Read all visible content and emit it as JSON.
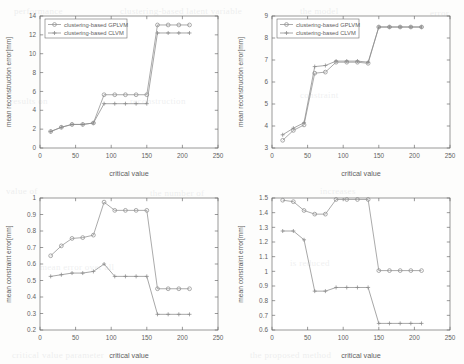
{
  "figure": {
    "legend_labels": [
      "clustering-based GPLVM",
      "clustering-based CLVM"
    ],
    "series_colors": [
      "#8f8f8f",
      "#8a8a8a"
    ],
    "xlabel": "critical value",
    "background": "#fdfdfc"
  },
  "ghost_text": [
    {
      "t": "performance",
      "x": 14,
      "y": 6
    },
    {
      "t": "clustering-based latent variable",
      "x": 120,
      "y": 6
    },
    {
      "t": "the model",
      "x": 300,
      "y": 6
    },
    {
      "t": "error",
      "x": 430,
      "y": 8
    },
    {
      "t": "results on",
      "x": 10,
      "y": 96
    },
    {
      "t": "reconstruction",
      "x": 130,
      "y": 96
    },
    {
      "t": "constraint",
      "x": 300,
      "y": 90
    },
    {
      "t": "value of",
      "x": 6,
      "y": 186
    },
    {
      "t": "the number of",
      "x": 150,
      "y": 188
    },
    {
      "t": "increases",
      "x": 320,
      "y": 186
    },
    {
      "t": "mean error over all",
      "x": 40,
      "y": 262
    },
    {
      "t": "is reduced",
      "x": 290,
      "y": 258
    },
    {
      "t": "critical value parameter",
      "x": 12,
      "y": 350
    },
    {
      "t": "the proposed method",
      "x": 250,
      "y": 350
    }
  ],
  "chart_data": [
    {
      "type": "line",
      "panel": "top-left",
      "title": "",
      "xlabel": "critical value",
      "ylabel": "mean reconstruction error[mm]",
      "xlim": [
        0,
        250
      ],
      "ylim": [
        0,
        14
      ],
      "xticks": [
        0,
        50,
        100,
        150,
        200,
        250
      ],
      "yticks": [
        0,
        2,
        4,
        6,
        8,
        10,
        12,
        14
      ],
      "grid": false,
      "legend_position": "upper left",
      "series": [
        {
          "name": "clustering-based GPLVM",
          "marker": "circle",
          "x": [
            15,
            30,
            45,
            60,
            75,
            90,
            105,
            120,
            135,
            150,
            165,
            180,
            195,
            210
          ],
          "y": [
            1.75,
            2.2,
            2.5,
            2.5,
            2.65,
            5.65,
            5.65,
            5.65,
            5.65,
            5.65,
            13.05,
            13.05,
            13.05,
            13.05
          ]
        },
        {
          "name": "clustering-based CLVM",
          "marker": "plus",
          "x": [
            15,
            30,
            45,
            60,
            75,
            90,
            105,
            120,
            135,
            150,
            165,
            180,
            195,
            210
          ],
          "y": [
            1.75,
            2.2,
            2.5,
            2.5,
            2.65,
            4.7,
            4.7,
            4.7,
            4.7,
            4.7,
            12.2,
            12.2,
            12.2,
            12.2
          ]
        }
      ]
    },
    {
      "type": "line",
      "panel": "top-right",
      "title": "",
      "xlabel": "critical value",
      "ylabel": "mean reconstruction error[mm]",
      "xlim": [
        0,
        250
      ],
      "ylim": [
        3,
        9
      ],
      "xticks": [
        0,
        50,
        100,
        150,
        200,
        250
      ],
      "yticks": [
        3,
        4,
        5,
        6,
        7,
        8,
        9
      ],
      "grid": false,
      "legend_position": "upper left",
      "series": [
        {
          "name": "clustering-based GPLVM",
          "marker": "circle",
          "x": [
            15,
            30,
            45,
            60,
            75,
            90,
            105,
            120,
            135,
            150,
            165,
            180,
            195,
            210
          ],
          "y": [
            3.35,
            3.8,
            4.05,
            6.4,
            6.45,
            6.9,
            6.9,
            6.9,
            6.85,
            8.5,
            8.5,
            8.5,
            8.5,
            8.5
          ]
        },
        {
          "name": "clustering-based CLVM",
          "marker": "plus",
          "x": [
            15,
            30,
            45,
            60,
            75,
            90,
            105,
            120,
            135,
            150,
            165,
            180,
            195,
            210
          ],
          "y": [
            3.6,
            3.9,
            4.15,
            6.7,
            6.75,
            6.95,
            6.95,
            6.95,
            6.9,
            8.5,
            8.5,
            8.5,
            8.5,
            8.5
          ]
        }
      ]
    },
    {
      "type": "line",
      "panel": "bottom-left",
      "title": "",
      "xlabel": "critical value",
      "ylabel": "mean constraint error[mm]",
      "xlim": [
        0,
        250
      ],
      "ylim": [
        0.2,
        1.0
      ],
      "xticks": [
        0,
        50,
        100,
        150,
        200,
        250
      ],
      "yticks": [
        0.2,
        0.3,
        0.4,
        0.5,
        0.6,
        0.7,
        0.8,
        0.9,
        1.0
      ],
      "grid": false,
      "legend_position": "none",
      "series": [
        {
          "name": "clustering-based GPLVM",
          "marker": "circle",
          "x": [
            15,
            30,
            45,
            60,
            75,
            90,
            105,
            120,
            135,
            150,
            165,
            180,
            195,
            210
          ],
          "y": [
            0.65,
            0.71,
            0.755,
            0.76,
            0.775,
            0.975,
            0.925,
            0.925,
            0.925,
            0.925,
            0.45,
            0.45,
            0.45,
            0.45
          ]
        },
        {
          "name": "clustering-based CLVM",
          "marker": "plus",
          "x": [
            15,
            30,
            45,
            60,
            75,
            90,
            105,
            120,
            135,
            150,
            165,
            180,
            195,
            210
          ],
          "y": [
            0.525,
            0.535,
            0.545,
            0.545,
            0.555,
            0.6,
            0.525,
            0.525,
            0.525,
            0.525,
            0.295,
            0.295,
            0.295,
            0.295
          ]
        }
      ]
    },
    {
      "type": "line",
      "panel": "bottom-right",
      "title": "",
      "xlabel": "critical value",
      "ylabel": "mean constraint error[mm]",
      "xlim": [
        0,
        250
      ],
      "ylim": [
        0.6,
        1.5
      ],
      "xticks": [
        0,
        50,
        100,
        150,
        200,
        250
      ],
      "yticks": [
        0.6,
        0.7,
        0.8,
        0.9,
        1.0,
        1.1,
        1.2,
        1.3,
        1.4,
        1.5
      ],
      "grid": false,
      "legend_position": "none",
      "series": [
        {
          "name": "clustering-based GPLVM",
          "marker": "circle",
          "x": [
            15,
            30,
            45,
            60,
            75,
            90,
            105,
            120,
            135,
            150,
            165,
            180,
            195,
            210
          ],
          "y": [
            1.485,
            1.475,
            1.415,
            1.39,
            1.39,
            1.49,
            1.49,
            1.49,
            1.49,
            1.005,
            1.005,
            1.005,
            1.005,
            1.005
          ]
        },
        {
          "name": "clustering-based CLVM",
          "marker": "plus",
          "x": [
            15,
            30,
            45,
            60,
            75,
            90,
            105,
            120,
            135,
            150,
            165,
            180,
            195,
            210
          ],
          "y": [
            1.275,
            1.275,
            1.215,
            0.865,
            0.865,
            0.89,
            0.89,
            0.89,
            0.89,
            0.645,
            0.645,
            0.645,
            0.645,
            0.645
          ]
        }
      ]
    }
  ]
}
